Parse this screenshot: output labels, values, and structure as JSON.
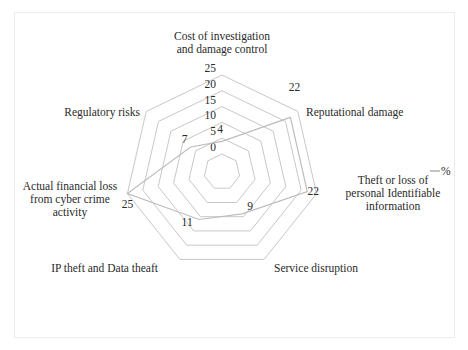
{
  "chart_data": {
    "type": "radar",
    "title": "",
    "categories": [
      "Cost of investigation and damage control",
      "Reputational damage",
      "Theft or loss of personal Identifiable information",
      "Service disruption",
      "IP theft and Data theaft",
      "Actual financial loss from cyber crime activity",
      "Regulatory risks"
    ],
    "category_lines": [
      [
        "Cost of investigation",
        "and damage control"
      ],
      [
        "Reputational damage"
      ],
      [
        "Theft or loss of",
        "personal Identifiable",
        "information"
      ],
      [
        "Service disruption"
      ],
      [
        "IP theft and Data theaft"
      ],
      [
        "Actual financial loss",
        "from cyber crime",
        "activity"
      ],
      [
        "Regulatory risks"
      ]
    ],
    "series": [
      {
        "name": "%",
        "values": [
          4,
          22,
          22,
          9,
          11,
          25,
          7
        ],
        "color": "#bdbdbd"
      }
    ],
    "radial_ticks": [
      0,
      5,
      10,
      15,
      20,
      25
    ],
    "rlim": [
      0,
      25
    ],
    "grid": true,
    "grid_color": "#c8c8c8",
    "legend": {
      "position": "right",
      "entries": [
        "%"
      ],
      "marker": "—"
    }
  }
}
